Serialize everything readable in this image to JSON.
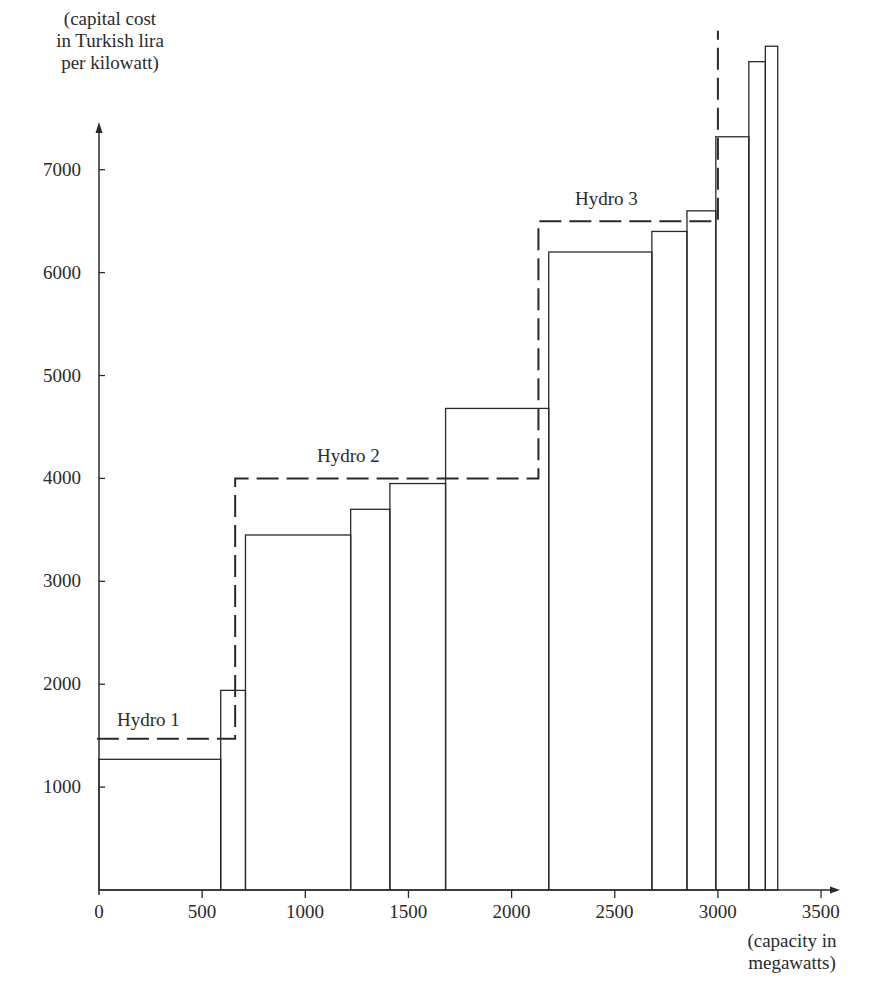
{
  "chart_data": {
    "type": "bar",
    "title": "",
    "xlabel": "(capacity in megawatts)",
    "ylabel": "(capital cost in Turkish lira per kilowatt)",
    "xlabel_lines": [
      "(capacity in",
      "megawatts)"
    ],
    "ylabel_lines": [
      "(capital cost",
      "in Turkish lira",
      "per kilowatt)"
    ],
    "xlim": [
      0,
      3600
    ],
    "ylim": [
      0,
      8500
    ],
    "xticks": [
      0,
      500,
      1000,
      1500,
      2000,
      2500,
      3000,
      3500
    ],
    "yticks": [
      1000,
      2000,
      3000,
      4000,
      5000,
      6000,
      7000
    ],
    "grid": false,
    "bars": [
      {
        "x0": 0,
        "x1": 590,
        "value": 1270
      },
      {
        "x0": 590,
        "x1": 710,
        "value": 1940
      },
      {
        "x0": 710,
        "x1": 1220,
        "value": 3450
      },
      {
        "x0": 1220,
        "x1": 1410,
        "value": 3700
      },
      {
        "x0": 1410,
        "x1": 1680,
        "value": 3950
      },
      {
        "x0": 1680,
        "x1": 2180,
        "value": 4680
      },
      {
        "x0": 2180,
        "x1": 2680,
        "value": 6200
      },
      {
        "x0": 2680,
        "x1": 2850,
        "value": 6400
      },
      {
        "x0": 2850,
        "x1": 2990,
        "value": 6600
      },
      {
        "x0": 2990,
        "x1": 3150,
        "value": 7320
      },
      {
        "x0": 3150,
        "x1": 3230,
        "value": 8050
      },
      {
        "x0": 3230,
        "x1": 3290,
        "value": 8200
      }
    ],
    "step_line": {
      "style": "dashed",
      "segments": [
        {
          "label": "Hydro 1",
          "x0": -10,
          "x1": 660,
          "value": 1470
        },
        {
          "label": "Hydro 2",
          "x0": 660,
          "x1": 2130,
          "value": 4000
        },
        {
          "label": "Hydro 3",
          "x0": 2130,
          "x1": 3000,
          "value": 6500
        }
      ],
      "end_x": 3000,
      "end_value": 8350
    },
    "annotations": [
      "Hydro 1",
      "Hydro 2",
      "Hydro 3"
    ]
  }
}
